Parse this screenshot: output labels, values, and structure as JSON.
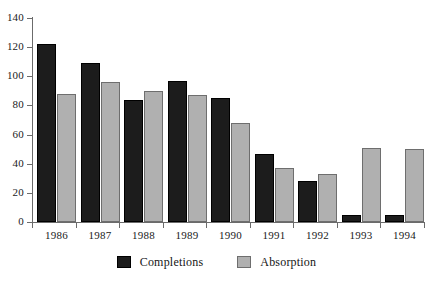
{
  "chart_data": {
    "type": "bar",
    "title": "",
    "subtitle": "",
    "xlabel": "",
    "ylabel": "",
    "categories": [
      "1986",
      "1987",
      "1988",
      "1989",
      "1990",
      "1991",
      "1992",
      "1993",
      "1994"
    ],
    "series": [
      {
        "name": "Completions",
        "color": "#1c1c1c",
        "values": [
          122,
          109,
          84,
          97,
          85,
          47,
          28,
          5,
          5
        ]
      },
      {
        "name": "Absorption",
        "color": "#b0b0b0",
        "values": [
          88,
          96,
          90,
          87,
          68,
          37,
          33,
          51,
          50
        ]
      }
    ],
    "ylim": [
      0,
      140
    ],
    "ytick_step": 20,
    "yticks": [
      0,
      20,
      40,
      60,
      80,
      100,
      120,
      140
    ],
    "ytick_labels": [
      "0",
      "20",
      "40",
      "60",
      "80",
      "100",
      "120",
      "140"
    ],
    "grid": false,
    "legend_position": "bottom",
    "legend_entries": [
      "Completions",
      "Absorption"
    ],
    "annotations": []
  },
  "legend": {
    "completions_label": "Completions",
    "absorption_label": "Absorption"
  },
  "colors": {
    "completions": "#1c1c1c",
    "absorption": "#b0b0b0",
    "axis": "#6b6b6b",
    "background": "#ffffff",
    "text": "#1a1a1a"
  }
}
